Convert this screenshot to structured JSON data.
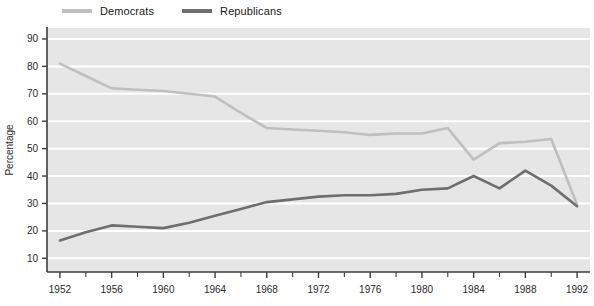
{
  "chart_data": {
    "type": "line",
    "title": "",
    "xlabel": "",
    "ylabel": "Percentage",
    "xlim": [
      1951,
      1993
    ],
    "ylim": [
      5,
      94
    ],
    "grid": true,
    "grid_axis": "y",
    "legend_position": "top-left",
    "x_tick_labels": [
      "1952",
      "1956",
      "1960",
      "1964",
      "1968",
      "1972",
      "1976",
      "1980",
      "1984",
      "1988",
      "1992"
    ],
    "x_ticks": [
      1952,
      1956,
      1960,
      1964,
      1968,
      1972,
      1976,
      1980,
      1984,
      1988,
      1992
    ],
    "x_minor_ticks": [
      1954,
      1958,
      1962,
      1966,
      1970,
      1974,
      1978,
      1982,
      1986,
      1990
    ],
    "y_tick_labels": [
      "10",
      "20",
      "30",
      "40",
      "50",
      "60",
      "70",
      "80",
      "90"
    ],
    "y_ticks": [
      10,
      20,
      30,
      40,
      50,
      60,
      70,
      80,
      90
    ],
    "x": [
      1952,
      1954,
      1956,
      1958,
      1960,
      1962,
      1964,
      1966,
      1968,
      1970,
      1972,
      1974,
      1976,
      1978,
      1980,
      1982,
      1984,
      1986,
      1988,
      1990,
      1992
    ],
    "series": [
      {
        "name": "Democrats",
        "color": "#bfbfbf",
        "values": [
          81,
          76.5,
          72,
          71.5,
          71,
          70,
          69,
          63,
          57.5,
          57,
          56.5,
          56,
          55,
          55.5,
          55.5,
          57.5,
          46,
          52,
          52.5,
          53.5,
          29.5
        ]
      },
      {
        "name": "Republicans",
        "color": "#6e6e6e",
        "values": [
          16.5,
          19.5,
          22,
          21.5,
          21,
          23,
          25.5,
          28,
          30.5,
          31.5,
          32.5,
          33,
          33,
          33.5,
          35,
          35.5,
          40,
          35.5,
          42,
          36.5,
          29
        ]
      }
    ]
  },
  "legend": {
    "entries": [
      {
        "label": "Democrats"
      },
      {
        "label": "Republicans"
      }
    ]
  },
  "colors": {
    "plot_background": "#e6e6e6",
    "gridline": "#ffffff",
    "axis": "#3d3d3d",
    "text": "#2b2b2b",
    "page_background": "#ffffff"
  }
}
